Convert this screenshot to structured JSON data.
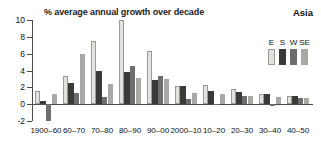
{
  "chart_data": {
    "type": "bar",
    "title": "% average annual growth over decade",
    "region_label": "Asia",
    "xlabel": "",
    "ylabel": "",
    "ylim": [
      -2,
      10
    ],
    "yticks": [
      10,
      8,
      6,
      4,
      2,
      0,
      -2
    ],
    "ytick_labels": [
      "10",
      "8",
      "6",
      "4",
      "2",
      "0",
      "-2"
    ],
    "grid": false,
    "legend_position": "top-right",
    "categories": [
      "1900–60",
      "60–70",
      "70–80",
      "80–90",
      "90–00",
      "2000–10",
      "10–20",
      "20–30",
      "30–40",
      "40–50"
    ],
    "series": [
      {
        "name": "E",
        "color": "#e2e1dd",
        "values": [
          1.6,
          3.35,
          7.5,
          10.0,
          6.35,
          2.1,
          2.25,
          1.75,
          1.25,
          0.95
        ]
      },
      {
        "name": "S",
        "color": "#3a3a3a",
        "values": [
          0.4,
          2.5,
          4.0,
          3.8,
          2.85,
          2.1,
          1.55,
          1.4,
          1.15,
          0.95
        ]
      },
      {
        "name": "W",
        "color": "#6e6e6e",
        "values": [
          -2.0,
          1.35,
          0.9,
          4.5,
          3.3,
          0.6,
          -0.15,
          1.0,
          -0.2,
          0.7
        ]
      },
      {
        "name": "SE",
        "color": "#a8a8a4",
        "values": [
          1.25,
          5.95,
          2.4,
          3.05,
          2.95,
          1.3,
          1.25,
          0.95,
          0.85,
          0.7
        ]
      }
    ]
  },
  "legend": {
    "entries": [
      {
        "label": "E",
        "color": "#e2e1dd"
      },
      {
        "label": "S",
        "color": "#3a3a3a"
      },
      {
        "label": "W",
        "color": "#6e6e6e"
      },
      {
        "label": "SE",
        "color": "#a8a8a4"
      }
    ]
  }
}
